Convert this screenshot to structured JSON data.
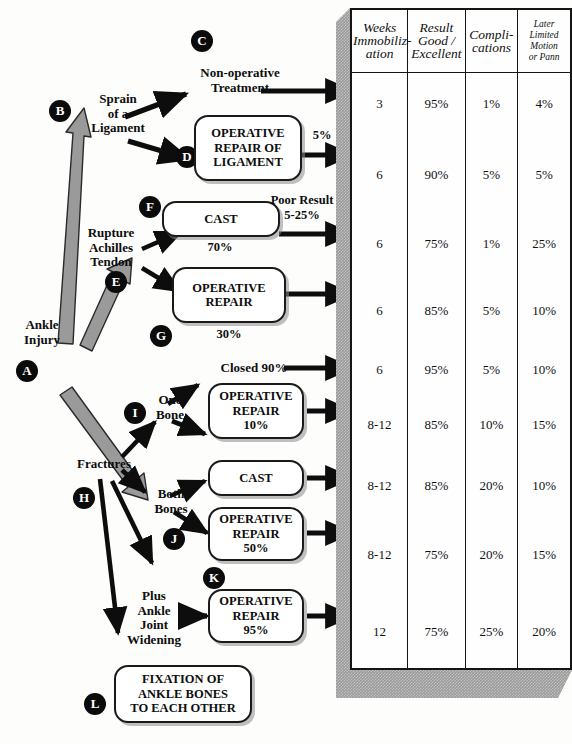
{
  "root": {
    "label": "Ankle\nInjury",
    "badge": "A"
  },
  "branches": [
    {
      "badge": "B",
      "label": "Sprain\nof a\nLigament",
      "treatments": [
        {
          "badge": "C",
          "label": "Non-operative\nTreatment",
          "boxed": false,
          "annot": "",
          "side_annot": ""
        },
        {
          "badge": "D",
          "label": "OPERATIVE\nREPAIR OF\nLIGAMENT",
          "boxed": true,
          "annot": "",
          "side_annot": "5%"
        }
      ]
    },
    {
      "badge": "E",
      "label": "Rupture\nAchilles\nTendon",
      "treatments": [
        {
          "badge": "F",
          "label": "CAST",
          "boxed": true,
          "annot": "70%",
          "side_annot": "Poor Result\n5-25%"
        },
        {
          "badge": "G",
          "label": "OPERATIVE\nREPAIR",
          "boxed": true,
          "annot": "30%",
          "side_annot": ""
        }
      ]
    },
    {
      "badge": "H",
      "label": "Fractures",
      "subgroups": [
        {
          "badge": "I",
          "label": "One\nBone",
          "treatments": [
            {
              "label": "Closed  90%",
              "boxed": false,
              "annot": ""
            },
            {
              "label": "OPERATIVE\nREPAIR\n10%",
              "boxed": true,
              "annot": ""
            }
          ]
        },
        {
          "badge": "J",
          "label": "Both\nBones",
          "treatments": [
            {
              "label": "CAST",
              "boxed": true,
              "annot": ""
            },
            {
              "label": "OPERATIVE\nREPAIR\n50%",
              "boxed": true,
              "annot": ""
            }
          ]
        },
        {
          "badge": "K",
          "label": "Plus\nAnkle\nJoint\nWidening",
          "treatments": [
            {
              "label": "OPERATIVE\nREPAIR\n95%",
              "boxed": true,
              "annot": ""
            }
          ]
        }
      ],
      "terminal": {
        "badge": "L",
        "label": "FIXATION OF\nANKLE BONES\nTO EACH OTHER"
      }
    }
  ],
  "table": {
    "headers": [
      "Weeks\nImmobiliz-\nation",
      "Result\nGood /\nExcellent",
      "Compli-\ncations",
      "Later\nLimited\nMotion\nor Pann"
    ],
    "rows": [
      {
        "weeks": "3",
        "result": "95%",
        "complications": "1%",
        "later": "4%"
      },
      {
        "weeks": "6",
        "result": "90%",
        "complications": "5%",
        "later": "5%"
      },
      {
        "weeks": "6",
        "result": "75%",
        "complications": "1%",
        "later": "25%"
      },
      {
        "weeks": "6",
        "result": "85%",
        "complications": "5%",
        "later": "10%"
      },
      {
        "weeks": "6",
        "result": "95%",
        "complications": "5%",
        "later": "10%"
      },
      {
        "weeks": "8-12",
        "result": "85%",
        "complications": "10%",
        "later": "15%"
      },
      {
        "weeks": "8-12",
        "result": "85%",
        "complications": "20%",
        "later": "10%"
      },
      {
        "weeks": "8-12",
        "result": "75%",
        "complications": "20%",
        "later": "15%"
      },
      {
        "weeks": "12",
        "result": "75%",
        "complications": "25%",
        "later": "20%"
      }
    ]
  },
  "colors": {
    "ink": "#0d0d0d",
    "badge_bg": "#0b0b0b",
    "badge_fg": "#ffffff",
    "gray_arrow": "#9a9a9a",
    "table_shadow": "#9a9a9a",
    "paper": "#fdfdfc"
  }
}
